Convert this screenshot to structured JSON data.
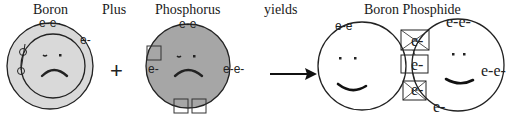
{
  "labels": {
    "boron": "Boron",
    "plus": "Plus",
    "phosphorus": "Phosphorus",
    "yields": "yields",
    "product": "Boron Phosphide"
  },
  "symbols": {
    "plus_sign": "+",
    "arrow": "→"
  },
  "electrons": {
    "boron_top": "e-e-",
    "boron_right": "e-",
    "phosphorus_top": "e-e",
    "phosphorus_left": "e-",
    "phosphorus_right": "e-e-",
    "bp_left_top": "e-e",
    "bp_right_top": "e-e-",
    "bp_right_side": "e-e-",
    "bp_bond_top": "e-",
    "bp_bond_middle": "e-",
    "bp_bond_bottom": "e-",
    "bp_bottom": "e-"
  },
  "colors": {
    "boron_outer_shell": "#d9d9d9",
    "boron_inner": "#d9d9d9",
    "phosphorus_fill": "#a6a6a6",
    "stroke": "#222222",
    "product_fill": "#ffffff"
  },
  "faces": {
    "boron": "sad",
    "phosphorus": "sad",
    "boron_phosphide_left": "happy",
    "boron_phosphide_right": "happy"
  }
}
